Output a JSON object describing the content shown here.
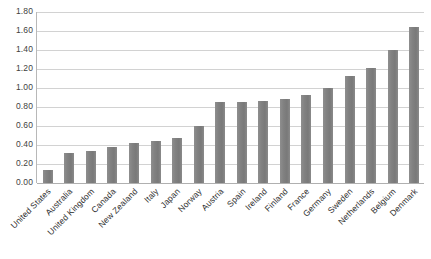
{
  "chart_data": {
    "type": "bar",
    "title": "",
    "subtitle": "",
    "xlabel": "",
    "ylabel": "",
    "ylim": [
      0.0,
      1.8
    ],
    "ytick_step": 0.2,
    "ytick_labels": [
      "1.80",
      "1.60",
      "1.40",
      "1.20",
      "1.00",
      "0.80",
      "0.60",
      "0.40",
      "0.20",
      "0.00"
    ],
    "ytick_values": [
      1.8,
      1.6,
      1.4,
      1.2,
      1.0,
      0.8,
      0.6,
      0.4,
      0.2,
      0.0
    ],
    "grid": true,
    "grid_axis": "y",
    "legend": false,
    "legend_position": "none",
    "categories": [
      "United States",
      "Australia",
      "United Kingdom",
      "Canada",
      "New Zealand",
      "Italy",
      "Japan",
      "Norway",
      "Austria",
      "Spain",
      "Ireland",
      "Finland",
      "France",
      "Germany",
      "Sweden",
      "Netherlands",
      "Belgium",
      "Denmark"
    ],
    "values": [
      0.14,
      0.32,
      0.34,
      0.38,
      0.42,
      0.44,
      0.47,
      0.6,
      0.85,
      0.85,
      0.86,
      0.88,
      0.93,
      1.0,
      1.13,
      1.21,
      1.4,
      1.64
    ],
    "series": [
      {
        "name": "",
        "values": [
          0.14,
          0.32,
          0.34,
          0.38,
          0.42,
          0.44,
          0.47,
          0.6,
          0.85,
          0.85,
          0.86,
          0.88,
          0.93,
          1.0,
          1.13,
          1.21,
          1.4,
          1.64
        ]
      }
    ],
    "bar_color": "#808080",
    "gridline_color": "#d2d2d2",
    "axis_color": "#b8b8b8",
    "background_color": "#ffffff",
    "label_rotation_degrees": -45
  }
}
